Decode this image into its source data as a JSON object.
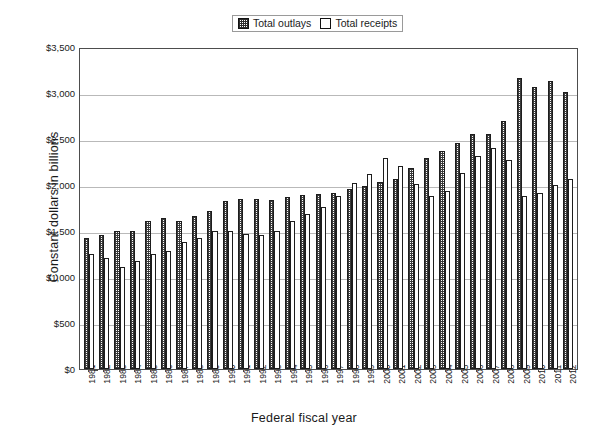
{
  "chart_data": {
    "type": "bar",
    "title": "",
    "xlabel": "Federal fiscal year",
    "ylabel": "Constant dollars in billions",
    "ylim": [
      0,
      3500
    ],
    "ytick_labels": [
      "$3,500",
      "$3,000",
      "$2,500",
      "$2,000",
      "$1,500",
      "$1,000",
      "$500",
      "$0"
    ],
    "ytick_values": [
      3500,
      3000,
      2500,
      2000,
      1500,
      1000,
      500,
      0
    ],
    "grid": true,
    "legend_position": "top-center",
    "categories": [
      "1981",
      "1982",
      "1983",
      "1984",
      "1985",
      "1986",
      "1987",
      "1988",
      "1989",
      "1990",
      "1991",
      "1992",
      "1993",
      "1994",
      "1995",
      "1996",
      "1997",
      "1998",
      "1999",
      "2000",
      "2001",
      "2002",
      "2003",
      "2004",
      "2005",
      "2006",
      "2007",
      "2008",
      "2009",
      "2010",
      "2011",
      "2012"
    ],
    "series": [
      {
        "name": "Total outlays",
        "pattern": "hatched",
        "values": [
          1420,
          1455,
          1500,
          1500,
          1605,
          1640,
          1610,
          1660,
          1720,
          1825,
          1845,
          1850,
          1840,
          1870,
          1890,
          1900,
          1915,
          1955,
          1990,
          2030,
          2060,
          2190,
          2295,
          2370,
          2460,
          2550,
          2550,
          2695,
          3165,
          3060,
          3130,
          3010
        ]
      },
      {
        "name": "Total receipts",
        "pattern": "open",
        "values": [
          1255,
          1205,
          1110,
          1170,
          1250,
          1280,
          1380,
          1425,
          1495,
          1505,
          1465,
          1460,
          1500,
          1605,
          1685,
          1765,
          1880,
          2025,
          2120,
          2295,
          2205,
          2015,
          1885,
          1935,
          2135,
          2310,
          2405,
          2275,
          1880,
          1915,
          1995,
          2070
        ]
      }
    ]
  },
  "legend": {
    "entries": [
      {
        "label": "Total outlays",
        "swatch": "hatched-swatch"
      },
      {
        "label": "Total receipts",
        "swatch": "empty-swatch"
      }
    ]
  },
  "axes": {
    "y_title": "Constant dollars in billions",
    "x_title": "Federal fiscal year"
  },
  "colors": {
    "frame": "#4d4d4d",
    "gridline": "#b9b9b9",
    "bar_outline": "#1d1d1d",
    "hatch": "#3a3a3a",
    "background": "#ffffff"
  }
}
